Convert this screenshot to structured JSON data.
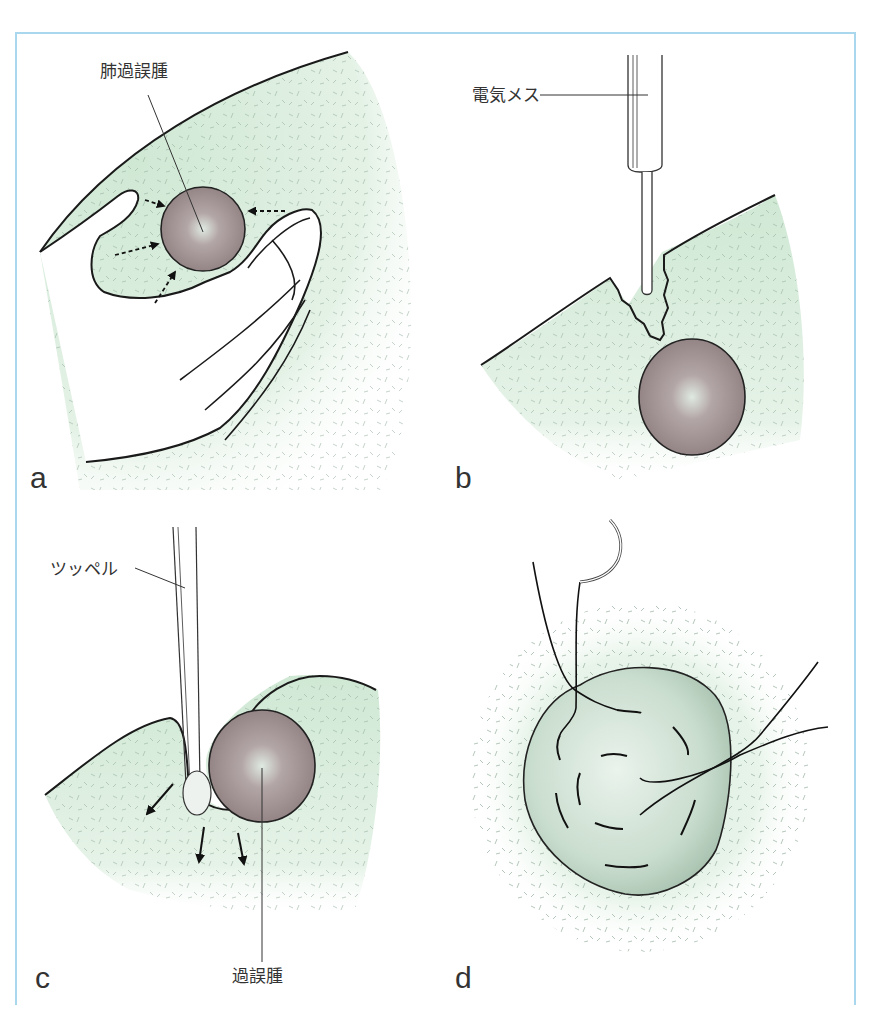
{
  "figure": {
    "colors": {
      "frame": "#a9d8ee",
      "lung_tissue": "#d6ecd9",
      "hamartoma": "#9c8a8a",
      "outline": "#1a1a1a"
    },
    "panels": [
      {
        "letter": "a",
        "labels": [
          {
            "text": "肺過誤腫",
            "target": "hamartoma"
          }
        ],
        "description": "Palpation of pulmonary hamartoma between fingers with arrows showing pressure"
      },
      {
        "letter": "b",
        "labels": [
          {
            "text": "電気メス",
            "target": "electrocautery"
          }
        ],
        "description": "Electrocautery incising lung tissue above the hamartoma"
      },
      {
        "letter": "c",
        "labels": [
          {
            "text": "ツッペル",
            "target": "peanut-dissector"
          },
          {
            "text": "過誤腫",
            "target": "hamartoma"
          }
        ],
        "description": "Blunt dissection with a peanut (Tupfer) sponge to enucleate the hamartoma; arrows indicate direction of push"
      },
      {
        "letter": "d",
        "labels": [],
        "description": "Closure of the enucleation bed with purse-string sutures and curved needle"
      }
    ]
  }
}
